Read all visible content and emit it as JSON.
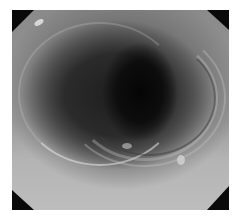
{
  "image": {
    "description": "Grayscale endoscopic view of a tubular lumen with concentric mucosal folds",
    "alt": "Endoscopic image of lumen"
  }
}
